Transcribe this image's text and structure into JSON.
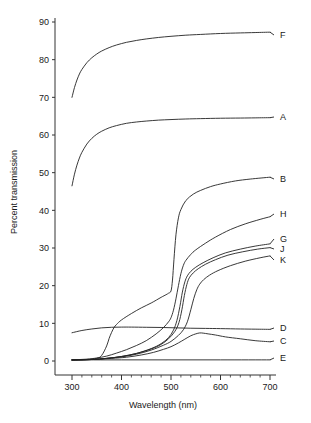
{
  "chart_data": {
    "type": "line",
    "title": "",
    "xlabel": "Wavelength (nm)",
    "ylabel": "Percent transmission",
    "xlim": [
      290,
      700
    ],
    "ylim": [
      -2,
      92
    ],
    "xticks": [
      300,
      400,
      500,
      600,
      700
    ],
    "xtick_labels": [
      "300",
      "400",
      "500",
      "600",
      "700"
    ],
    "xminor_step": 20,
    "yticks": [
      0,
      10,
      20,
      30,
      40,
      50,
      60,
      70,
      80,
      90
    ],
    "ytick_labels": [
      "0",
      "10",
      "20",
      "30",
      "40",
      "50",
      "60",
      "70",
      "80",
      "90"
    ],
    "grid": false,
    "legend_position": "right-inline-labels",
    "line_color": "#222222",
    "series": [
      {
        "name": "F",
        "label": "F",
        "label_value": 87.2,
        "x": [
          300,
          305,
          310,
          315,
          320,
          330,
          340,
          350,
          360,
          375,
          390,
          410,
          430,
          450,
          475,
          500,
          530,
          560,
          600,
          640,
          670,
          700
        ],
        "values": [
          70.0,
          72.6,
          74.6,
          76.2,
          77.4,
          79.2,
          80.5,
          81.5,
          82.3,
          83.2,
          83.9,
          84.6,
          85.1,
          85.5,
          85.9,
          86.2,
          86.5,
          86.7,
          86.95,
          87.1,
          87.2,
          87.3
        ]
      },
      {
        "name": "A",
        "label": "A",
        "label_value": 64.4,
        "x": [
          300,
          305,
          310,
          315,
          320,
          330,
          340,
          350,
          360,
          375,
          390,
          410,
          430,
          450,
          475,
          500,
          530,
          560,
          600,
          640,
          670,
          700
        ],
        "values": [
          46.5,
          49.6,
          52.0,
          53.9,
          55.4,
          57.6,
          59.1,
          60.2,
          61.0,
          61.9,
          62.5,
          63.1,
          63.45,
          63.7,
          63.95,
          64.1,
          64.25,
          64.35,
          64.45,
          64.5,
          64.55,
          64.6
        ]
      },
      {
        "name": "B",
        "label": "B",
        "label_value": 48.7,
        "x": [
          300,
          330,
          350,
          360,
          370,
          375,
          380,
          385,
          390,
          400,
          420,
          440,
          460,
          480,
          490,
          495,
          500,
          503,
          506,
          510,
          515,
          520,
          530,
          545,
          560,
          580,
          600,
          630,
          660,
          700
        ],
        "values": [
          0.3,
          0.4,
          0.7,
          1.5,
          4.0,
          6.0,
          7.6,
          8.9,
          9.7,
          10.9,
          12.6,
          14.1,
          15.4,
          16.9,
          17.6,
          18.0,
          18.6,
          21.5,
          27.0,
          33.5,
          38.0,
          40.2,
          42.6,
          44.3,
          45.3,
          46.3,
          47.0,
          47.8,
          48.3,
          48.8
        ]
      },
      {
        "name": "H",
        "label": "H",
        "label_value": 38.3,
        "x": [
          300,
          330,
          350,
          370,
          390,
          410,
          430,
          450,
          470,
          485,
          495,
          500,
          505,
          510,
          515,
          520,
          525,
          530,
          540,
          550,
          570,
          590,
          620,
          650,
          680,
          700
        ],
        "values": [
          0.3,
          0.5,
          0.8,
          1.3,
          2.1,
          3.0,
          4.1,
          5.4,
          7.2,
          8.9,
          10.4,
          11.5,
          13.5,
          16.5,
          20.0,
          23.2,
          25.4,
          26.7,
          28.3,
          29.5,
          31.3,
          32.9,
          34.9,
          36.4,
          37.6,
          38.3
        ]
      },
      {
        "name": "G",
        "label": "G",
        "label_value": 31.0,
        "x": [
          300,
          340,
          370,
          400,
          430,
          460,
          480,
          495,
          505,
          512,
          518,
          523,
          528,
          533,
          540,
          550,
          565,
          585,
          610,
          640,
          670,
          700
        ],
        "values": [
          0.25,
          0.4,
          0.7,
          1.2,
          2.0,
          3.3,
          4.6,
          6.2,
          8.2,
          10.8,
          14.5,
          18.3,
          21.0,
          22.6,
          23.8,
          24.9,
          26.1,
          27.4,
          28.7,
          29.7,
          30.5,
          31.1
        ]
      },
      {
        "name": "J",
        "label": "J",
        "label_value": 30.0,
        "x": [
          300,
          340,
          370,
          400,
          430,
          460,
          480,
          495,
          508,
          516,
          522,
          527,
          532,
          537,
          545,
          555,
          570,
          590,
          615,
          645,
          675,
          700
        ],
        "values": [
          0.25,
          0.4,
          0.7,
          1.2,
          2.0,
          3.2,
          4.4,
          5.9,
          7.9,
          10.2,
          13.6,
          17.4,
          20.3,
          22.1,
          23.4,
          24.5,
          25.7,
          26.9,
          28.1,
          29.0,
          29.7,
          30.1
        ]
      },
      {
        "name": "K",
        "label": "K",
        "label_value": 27.8,
        "x": [
          300,
          340,
          370,
          400,
          430,
          460,
          485,
          500,
          515,
          525,
          533,
          540,
          546,
          552,
          558,
          566,
          578,
          595,
          620,
          650,
          680,
          700
        ],
        "values": [
          0.25,
          0.4,
          0.7,
          1.1,
          1.8,
          2.9,
          4.2,
          5.2,
          6.8,
          8.3,
          10.4,
          13.6,
          16.6,
          18.9,
          20.4,
          21.6,
          22.8,
          24.0,
          25.3,
          26.5,
          27.4,
          27.9
        ]
      },
      {
        "name": "D",
        "label": "D",
        "label_value": 8.4,
        "x": [
          300,
          320,
          340,
          360,
          380,
          400,
          420,
          450,
          480,
          510,
          540,
          570,
          600,
          640,
          670,
          700
        ],
        "values": [
          7.5,
          8.1,
          8.5,
          8.8,
          8.95,
          9.0,
          9.0,
          8.95,
          8.9,
          8.8,
          8.7,
          8.65,
          8.6,
          8.5,
          8.45,
          8.4
        ]
      },
      {
        "name": "C",
        "label": "C",
        "label_value": 5.1,
        "x": [
          300,
          340,
          380,
          410,
          440,
          465,
          485,
          500,
          515,
          528,
          540,
          550,
          558,
          565,
          575,
          590,
          610,
          640,
          670,
          700
        ],
        "values": [
          0.3,
          0.4,
          0.7,
          1.0,
          1.6,
          2.3,
          3.1,
          3.8,
          4.8,
          5.8,
          6.7,
          7.2,
          7.45,
          7.4,
          7.2,
          6.9,
          6.4,
          5.9,
          5.4,
          5.1
        ]
      },
      {
        "name": "E",
        "label": "E",
        "label_value": 0.3,
        "x": [
          300,
          400,
          500,
          600,
          700
        ],
        "values": [
          0.3,
          0.3,
          0.3,
          0.3,
          0.3
        ]
      }
    ],
    "label_anchors": [
      {
        "name": "F",
        "y_px": 38
      },
      {
        "name": "A",
        "y_px": 120
      },
      {
        "name": "B",
        "y_px": 182
      },
      {
        "name": "H",
        "y_px": 217
      },
      {
        "name": "G",
        "y_px": 242
      },
      {
        "name": "J",
        "y_px": 252
      },
      {
        "name": "K",
        "y_px": 263
      },
      {
        "name": "D",
        "y_px": 331
      },
      {
        "name": "C",
        "y_px": 344
      },
      {
        "name": "E",
        "y_px": 361
      }
    ]
  }
}
